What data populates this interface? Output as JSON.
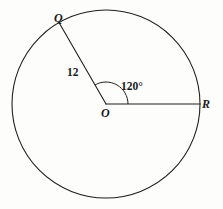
{
  "figure": {
    "kind": "circle-sector-diagram",
    "background_color": "#fdfdfc",
    "stroke_color": "#1f1f1f",
    "text_color": "#1a1a1a",
    "stroke_width": 1.1
  },
  "circle": {
    "center_x": 106,
    "center_y": 104,
    "radius": 94
  },
  "points": {
    "center": {
      "label": "O",
      "x": 106,
      "y": 104
    },
    "q": {
      "label": "Q",
      "x": 59,
      "y": 23,
      "angle_deg": 120
    },
    "r": {
      "label": "R",
      "x": 200,
      "y": 104,
      "angle_deg": 0
    }
  },
  "radii": [
    {
      "name": "OQ",
      "from": "O",
      "to": "Q",
      "length_label": "12"
    },
    {
      "name": "OR",
      "from": "O",
      "to": "R",
      "length_label": ""
    }
  ],
  "labels": {
    "point_q": "Q",
    "point_o": "O",
    "point_r": "R",
    "radius_length": "12",
    "central_angle": "120°"
  },
  "angle_marker": {
    "value": "120°",
    "degrees": 120,
    "arc_radius": 22,
    "start_angle_deg": 0,
    "end_angle_deg": 120
  }
}
